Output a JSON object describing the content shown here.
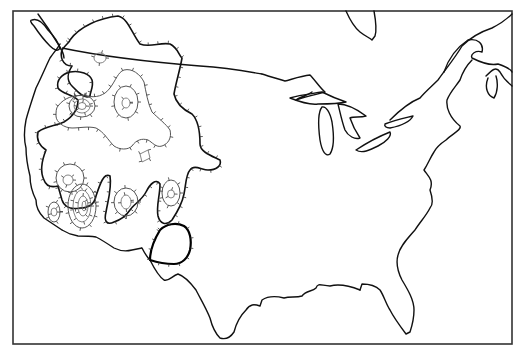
{
  "map": {
    "title": "",
    "region": "Contiguous United States and southern Canada",
    "style": "black-and-white line drawing",
    "features": [
      {
        "name": "coastline",
        "kind": "outline"
      },
      {
        "name": "us-canada-border",
        "kind": "boundary"
      },
      {
        "name": "us-mexico-border",
        "kind": "boundary"
      },
      {
        "name": "great-lakes",
        "kind": "water-outline"
      },
      {
        "name": "hudson-bay-james-bay",
        "kind": "water-outline"
      },
      {
        "name": "gulf-of-st-lawrence",
        "kind": "water-outline"
      }
    ],
    "contour_regions": [
      {
        "name": "western-outer-region",
        "levels": 1,
        "ticked": true
      },
      {
        "name": "northern-idaho-montana-centers",
        "levels": 3,
        "ticked": true
      },
      {
        "name": "nevada-california-centers",
        "levels": 4,
        "ticked": true
      },
      {
        "name": "utah-arizona-center",
        "levels": 2,
        "ticked": true
      },
      {
        "name": "colorado-new-mexico-center",
        "levels": 2,
        "ticked": true
      },
      {
        "name": "west-texas-bold-region",
        "levels": 1,
        "ticked": true
      }
    ],
    "colors": {
      "background": "#ffffff",
      "line": "#111111",
      "contour_light": "#777777"
    }
  }
}
